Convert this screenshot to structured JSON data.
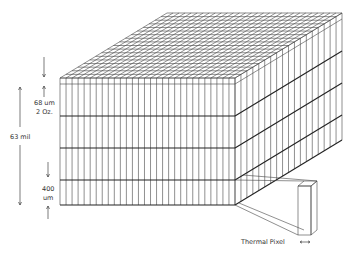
{
  "diagram": {
    "type": "isometric-layer-stack",
    "colors": {
      "line": "#333333",
      "background": "#ffffff"
    },
    "box": {
      "front": {
        "left": 60,
        "right": 235,
        "top": 78,
        "bottom": 205
      },
      "depth_offset": {
        "dx": 107,
        "dy": -65
      },
      "front_columns": 29,
      "side_columns": 18,
      "depth_rows": 18,
      "thin_row_y": 84,
      "thick_row_ys": [
        116,
        148,
        180
      ]
    },
    "thermal_pixel": {
      "front": {
        "left": 298,
        "right": 311,
        "top": 186,
        "bottom": 235
      },
      "back_offset": {
        "dx": 6,
        "dy": -5
      }
    },
    "labels": {
      "copper_thickness_line1": "68 um",
      "copper_thickness_line2": "2 Oz.",
      "total_thickness": "63 mil",
      "dielectric_line1": "400",
      "dielectric_line2": "um",
      "thermal_pixel": "Thermal Pixel"
    }
  }
}
